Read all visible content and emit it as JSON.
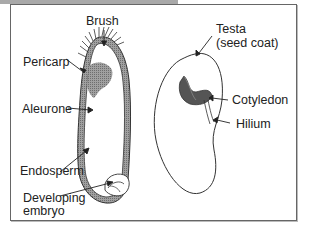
{
  "diagram": {
    "left_seed": {
      "labels": {
        "brush": "Brush",
        "pericarp": "Pericarp",
        "aleurone": "Aleurone",
        "endosperm": "Endosperm",
        "developing_embryo_line1": "Developing",
        "developing_embryo_line2": "embryo"
      }
    },
    "right_seed": {
      "labels": {
        "testa_line1": "Testa",
        "testa_line2": "(seed coat)",
        "cotyledon": "Cotyledon",
        "hilium": "Hilium"
      }
    },
    "colors": {
      "outline": "#333333",
      "coat_fill": "#8a8a8a",
      "aleurone_fill": "#9a9a9a",
      "cotyledon_fill": "#555555",
      "frame_border": "#666666",
      "top_bar": "#a9a9a9"
    }
  }
}
